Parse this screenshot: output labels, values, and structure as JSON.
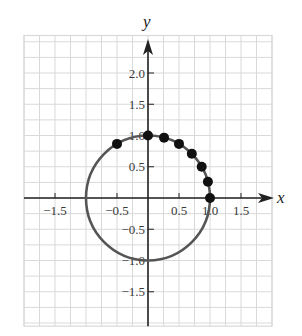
{
  "chart_data": {
    "type": "scatter",
    "title": "",
    "xlabel": "x",
    "ylabel": "y",
    "xlim": [
      -2.0,
      2.0
    ],
    "ylim": [
      -2.05,
      2.6
    ],
    "grid": true,
    "grid_step": 0.25,
    "x_ticks": [
      {
        "value": -1.5,
        "label": "−1.5"
      },
      {
        "value": -0.5,
        "label": "−0.5"
      },
      {
        "value": 0.5,
        "label": "0.5"
      },
      {
        "value": 1.0,
        "label": "1.0"
      },
      {
        "value": 1.5,
        "label": "1.5"
      }
    ],
    "y_ticks": [
      {
        "value": 2.0,
        "label": "2.0"
      },
      {
        "value": 1.5,
        "label": "1.5"
      },
      {
        "value": 1.0,
        "label": "1.0"
      },
      {
        "value": 0.5,
        "label": "0.5"
      },
      {
        "value": -0.5,
        "label": "−0.5"
      },
      {
        "value": -1.0,
        "label": "−1.0"
      },
      {
        "value": -1.5,
        "label": "−1.5"
      }
    ],
    "curve": {
      "name": "unit circle",
      "center": [
        0,
        0
      ],
      "radius": 1,
      "color": "#555555"
    },
    "points": {
      "name": "points on unit circle",
      "color": "#111111",
      "x": [
        1.0,
        0.966,
        0.866,
        0.707,
        0.5,
        0.259,
        0.0,
        -0.5
      ],
      "y": [
        0.0,
        0.259,
        0.5,
        0.707,
        0.866,
        0.966,
        1.0,
        0.866
      ]
    },
    "colors": {
      "grid": "#d9d9d9",
      "axis": "#222222"
    }
  }
}
